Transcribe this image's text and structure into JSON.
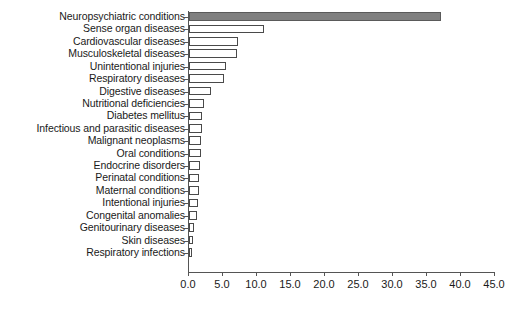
{
  "chart_data": {
    "type": "bar",
    "orientation": "horizontal",
    "title": "",
    "subtitle": "",
    "xlabel": "",
    "ylabel": "",
    "xlim": [
      0.0,
      45.0
    ],
    "xticks": [
      "0.0",
      "5.0",
      "10.0",
      "15.0",
      "20.0",
      "25.0",
      "30.0",
      "35.0",
      "40.0",
      "45.0"
    ],
    "xtick_values": [
      0.0,
      5.0,
      10.0,
      15.0,
      20.0,
      25.0,
      30.0,
      35.0,
      40.0,
      45.0
    ],
    "grid": false,
    "legend": "none",
    "categories": [
      "Neuropsychiatric conditions",
      "Sense organ diseases",
      "Cardiovascular diseases",
      "Musculoskeletal diseases",
      "Unintentional injuries",
      "Respiratory diseases",
      "Digestive diseases",
      "Nutritional deficiencies",
      "Diabetes mellitus",
      "Infectious and parasitic diseases",
      "Malignant neoplasms",
      "Oral conditions",
      "Endocrine disorders",
      "Perinatal conditions",
      "Maternal conditions",
      "Intentional injuries",
      "Congenital anomalies",
      "Genitourinary diseases",
      "Skin diseases",
      "Respiratory infections"
    ],
    "values": [
      37.0,
      11.0,
      7.2,
      7.1,
      5.4,
      5.1,
      3.2,
      2.2,
      1.9,
      1.9,
      1.8,
      1.7,
      1.6,
      1.5,
      1.4,
      1.3,
      1.2,
      0.8,
      0.6,
      0.5
    ],
    "highlight_index": 0,
    "colors": {
      "highlight_bar_fill": "#808080",
      "bar_fill": "#ffffff",
      "bar_outline": "#4a4a4a",
      "axis": "#555555",
      "text": "#1a1a1a",
      "background": "#ffffff"
    }
  }
}
